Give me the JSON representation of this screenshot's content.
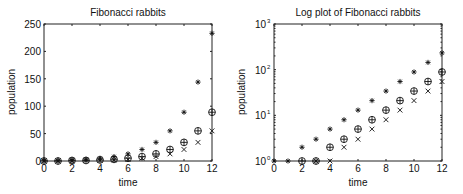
{
  "chart_data": [
    {
      "type": "scatter",
      "title": "Fibonacci rabbits",
      "xlabel": "time",
      "ylabel": "population",
      "xlim": [
        0,
        12
      ],
      "ylim": [
        0,
        250
      ],
      "yscale": "linear",
      "xticks": [
        0,
        2,
        4,
        6,
        8,
        10,
        12
      ],
      "yticks": [
        0,
        50,
        100,
        150,
        200,
        250
      ],
      "ytick_labels": [
        "0",
        "50",
        "100",
        "150",
        "200",
        "250"
      ],
      "grid": false,
      "x": [
        0,
        1,
        2,
        3,
        4,
        5,
        6,
        7,
        8,
        9,
        10,
        11,
        12
      ],
      "series": [
        {
          "name": "total",
          "marker": "asterisk",
          "values": [
            1,
            1,
            2,
            3,
            5,
            8,
            13,
            21,
            34,
            55,
            89,
            144,
            233
          ]
        },
        {
          "name": "adults",
          "marker": "circle-plus",
          "values": [
            0,
            0,
            1,
            1,
            2,
            3,
            5,
            8,
            13,
            21,
            34,
            55,
            89
          ]
        },
        {
          "name": "young",
          "marker": "x",
          "values": [
            0,
            0,
            0,
            1,
            1,
            2,
            3,
            5,
            8,
            13,
            21,
            34,
            55
          ]
        }
      ]
    },
    {
      "type": "scatter",
      "title": "Log plot of Fibonacci rabbits",
      "xlabel": "time",
      "ylabel": "population",
      "xlim": [
        0,
        12
      ],
      "ylim": [
        1,
        1000
      ],
      "yscale": "log",
      "xticks": [
        0,
        2,
        4,
        6,
        8,
        10,
        12
      ],
      "yticks": [
        1,
        10,
        100,
        1000
      ],
      "ytick_exponents": [
        "0",
        "1",
        "2",
        "3"
      ],
      "ytick_base": "10",
      "grid": false,
      "x": [
        0,
        1,
        2,
        3,
        4,
        5,
        6,
        7,
        8,
        9,
        10,
        11,
        12
      ],
      "series": [
        {
          "name": "total",
          "marker": "asterisk",
          "values": [
            1,
            1,
            2,
            3,
            5,
            8,
            13,
            21,
            34,
            55,
            89,
            144,
            233
          ]
        },
        {
          "name": "adults",
          "marker": "circle-plus",
          "values": [
            0,
            0,
            1,
            1,
            2,
            3,
            5,
            8,
            13,
            21,
            34,
            55,
            89
          ]
        },
        {
          "name": "young",
          "marker": "x",
          "values": [
            0,
            0,
            0,
            1,
            1,
            2,
            3,
            5,
            8,
            13,
            21,
            34,
            55
          ]
        }
      ]
    }
  ]
}
